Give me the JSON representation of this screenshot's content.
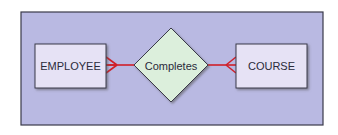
{
  "diagram": {
    "type": "entity-relationship",
    "entities": [
      {
        "id": "employee",
        "label": "EMPLOYEE",
        "cardinality_notation": "crow-foot (many)"
      },
      {
        "id": "course",
        "label": "COURSE",
        "cardinality_notation": "crow-foot (many)"
      }
    ],
    "relationships": [
      {
        "id": "completes",
        "label": "Completes",
        "connects": [
          "employee",
          "course"
        ]
      }
    ],
    "colors": {
      "panel_fill": "#b9b9e2",
      "panel_border": "#3a3a4a",
      "entity_fill": "#e6e2f5",
      "relationship_fill": "#dcefdc",
      "connector": "#d0202a"
    }
  }
}
